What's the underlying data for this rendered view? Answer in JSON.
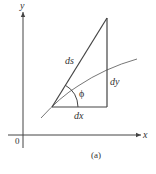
{
  "figure": {
    "caption": "(a)",
    "axes": {
      "x_label": "x",
      "y_label": "y",
      "origin_label": "0"
    },
    "triangle_labels": {
      "hypotenuse": "ds",
      "vertical_leg": "dy",
      "horizontal_leg": "dx",
      "angle": "ϕ"
    },
    "colors": {
      "line": "#444444",
      "curve": "#777777",
      "text": "#333333"
    }
  }
}
